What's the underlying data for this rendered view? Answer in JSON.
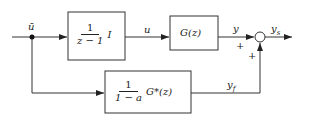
{
  "signals": {
    "input": "ū",
    "u": "u",
    "y": "y",
    "ys": "y",
    "ys_sub": "s",
    "yf": "y",
    "yf_sub": "f"
  },
  "signs": {
    "top": "+",
    "bottom": "+"
  },
  "blocks": {
    "integrator": {
      "num": "1",
      "den": "z − 1",
      "suffix": "I"
    },
    "plant": {
      "label": "G(z)"
    },
    "filter": {
      "num": "1",
      "den": "1 − a",
      "suffix": "G*(z)"
    }
  }
}
